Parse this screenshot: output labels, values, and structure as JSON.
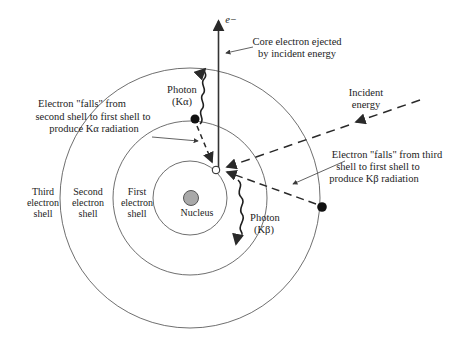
{
  "figure": {
    "type": "atomic-shell x-ray emission diagram"
  },
  "labels": {
    "ejected_electron": "e−",
    "core_ejected": {
      "line1": "Core electron ejected",
      "line2": "by incident energy"
    },
    "incident": {
      "line1": "Incident",
      "line2": "energy"
    },
    "photon_kalpha": {
      "line1": "Photon",
      "line2": "(Kα)"
    },
    "photon_kbeta": {
      "line1": "Photon",
      "line2": "(Kβ)"
    },
    "kalpha_note": {
      "line1": "Electron \"falls\" from",
      "line2": "second shell to first shell to",
      "line3": "produce Kα radiation"
    },
    "kbeta_note": {
      "line1": "Electron \"falls\" from third",
      "line2": "shell to first shell to",
      "line3": "produce Kβ radiation"
    },
    "third_shell": {
      "line1": "Third",
      "line2": "electron",
      "line3": "shell"
    },
    "second_shell": {
      "line1": "Second",
      "line2": "electron",
      "line3": "shell"
    },
    "first_shell": {
      "line1": "First",
      "line2": "electron",
      "line3": "shell"
    },
    "nucleus": "Nucleus"
  },
  "colors": {
    "background": "#ffffff",
    "line": "#3a3a3a",
    "text": "#1c1c1c",
    "nucleus_fill": "#a9a9a9",
    "nucleus_stroke": "#555555"
  }
}
